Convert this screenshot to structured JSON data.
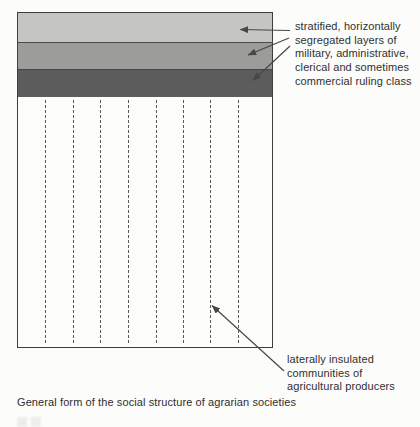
{
  "caption": "General form of the social structure of agrarian societies",
  "annotations": {
    "ruling_class": {
      "lines": [
        "stratified, horizontally",
        "segregated layers of",
        "military, administrative,",
        "clerical and sometimes",
        "commercial ruling class"
      ]
    },
    "producers": {
      "lines": [
        "laterally insulated",
        "communities of",
        "agricultural producers"
      ]
    }
  },
  "diagram": {
    "strata_colors": [
      "#c5c5c4",
      "#9c9c9b",
      "#5c5c5c"
    ],
    "box_border_color": "#3e3e3e",
    "dashed_line_count": "8",
    "dashed_line_color": "#585858",
    "arrow_color": "#474747"
  }
}
